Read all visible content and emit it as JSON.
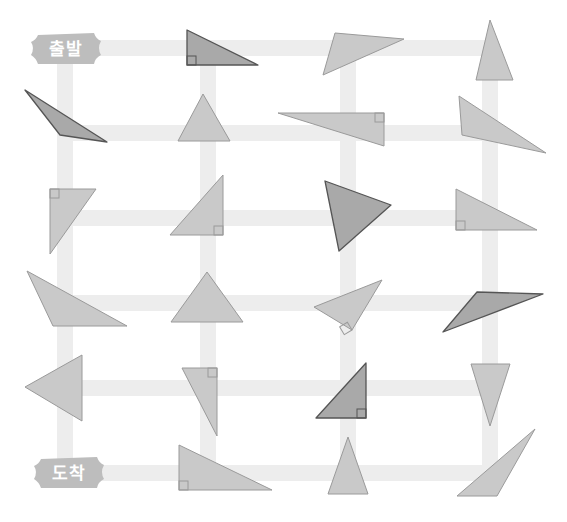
{
  "labels": {
    "start": "출발",
    "end": "도착"
  },
  "colors": {
    "background": "#ffffff",
    "path": "#ededed",
    "label_fill": "#bdbdbd",
    "triangle_light": "#c9c9c9",
    "triangle_dark": "#a9a9a9",
    "stroke_light": "#9a9a9a",
    "stroke_dark": "#555555"
  },
  "grid": {
    "rows_y": [
      48,
      133,
      218,
      303,
      388,
      473
    ],
    "cols_x": [
      65,
      208,
      348,
      490
    ]
  },
  "triangles": [
    {
      "id": "r0c1",
      "points": "187,30 187,65 258,65",
      "shade": "dark",
      "right_angle": [
        187,
        65,
        "tr"
      ]
    },
    {
      "id": "r0c2",
      "points": "335,33 404,39 323,75",
      "shade": "light"
    },
    {
      "id": "r0c3",
      "points": "490,20 476,80 513,80",
      "shade": "light"
    },
    {
      "id": "r1c0",
      "points": "25,90 60,135 107,142",
      "shade": "dark"
    },
    {
      "id": "r1c1",
      "points": "203,94 178,141 230,141",
      "shade": "light"
    },
    {
      "id": "r1c2",
      "points": "278,113 384,113 384,146",
      "shade": "light",
      "right_angle": [
        384,
        113,
        "bl"
      ]
    },
    {
      "id": "r1c3",
      "points": "459,96 462,135 546,153",
      "shade": "light"
    },
    {
      "id": "r2c0",
      "points": "50,189 96,189 50,254",
      "shade": "light",
      "right_angle": [
        50,
        189,
        "br"
      ]
    },
    {
      "id": "r2c1",
      "points": "223,175 223,235 170,235",
      "shade": "light",
      "right_angle": [
        223,
        235,
        "tl"
      ]
    },
    {
      "id": "r2c2",
      "points": "325,181 391,205 339,251",
      "shade": "dark"
    },
    {
      "id": "r2c3",
      "points": "456,189 537,230 456,230",
      "shade": "light",
      "right_angle": [
        456,
        230,
        "tr"
      ]
    },
    {
      "id": "r3c0",
      "points": "27,271 53,326 127,326",
      "shade": "light"
    },
    {
      "id": "r3c1",
      "points": "207,272 171,322 243,322",
      "shade": "light"
    },
    {
      "id": "r3c2",
      "points": "382,280 314,307 352,330",
      "shade": "light",
      "right_angle_rot": [
        352,
        330,
        -31
      ]
    },
    {
      "id": "r3c3",
      "points": "477,292 543,294 443,332",
      "shade": "dark"
    },
    {
      "id": "r4c0",
      "points": "82,355 82,421 25,387",
      "shade": "light"
    },
    {
      "id": "r4c1",
      "points": "182,368 217,368 217,436",
      "shade": "light",
      "right_angle": [
        217,
        368,
        "bl"
      ]
    },
    {
      "id": "r4c2",
      "points": "366,363 366,418 316,418",
      "shade": "dark",
      "right_angle": [
        366,
        418,
        "tl"
      ]
    },
    {
      "id": "r4c3",
      "points": "471,364 510,364 490,426",
      "shade": "light"
    },
    {
      "id": "r5c1",
      "points": "179,445 179,490 272,490",
      "shade": "light",
      "right_angle": [
        179,
        490,
        "tr"
      ]
    },
    {
      "id": "r5c2",
      "points": "348,437 328,494 368,494",
      "shade": "light"
    },
    {
      "id": "r5c3",
      "points": "535,429 457,496 497,496",
      "shade": "light"
    }
  ]
}
